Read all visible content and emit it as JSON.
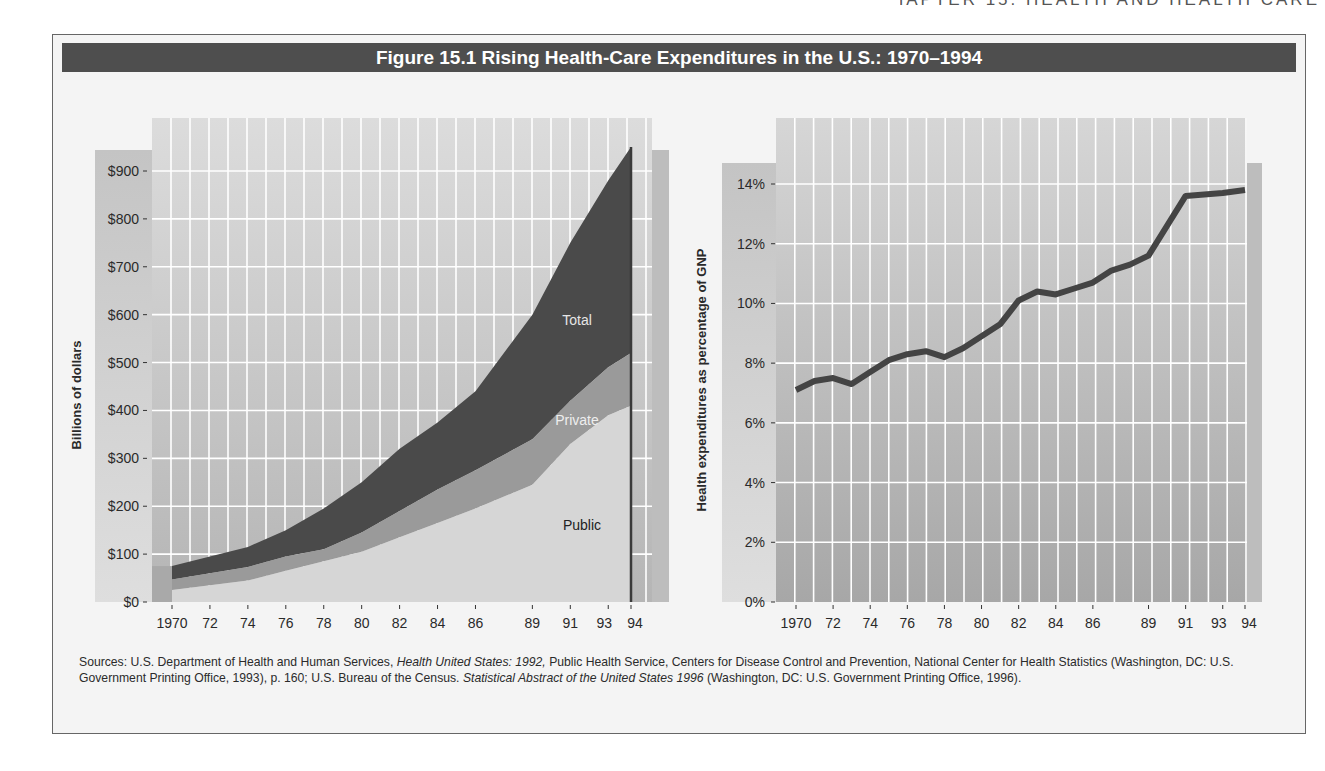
{
  "page": {
    "running_head": "CHAPTER 15: HEALTH AND HEALTH CARE"
  },
  "figure": {
    "title": "Figure 15.1  Rising Health-Care Expenditures in the U.S.: 1970–1994",
    "sources": {
      "prefix": "Sources: U.S. Department of Health and Human Services, ",
      "italic1": "Health United States: 1992,",
      "mid": " Public Health Service, Centers for Disease Control and Prevention, National Center for Health Statistics (Washington, DC: U.S. Government Printing Office, 1993), p. 160; U.S. Bureau of the Census. ",
      "italic2": "Statistical Abstract of the United States 1996",
      "suffix": " (Washington, DC: U.S. Government Printing Office, 1996)."
    }
  },
  "colors": {
    "title_bar": "#4e4e4e",
    "plot_bg_top": "#d9d9d9",
    "plot_bg_bottom": "#a9a9a9",
    "grid": "#ffffff",
    "total_band": "#4a4a4a",
    "private_band": "#9a9a9a",
    "public_band": "#d6d6d6",
    "line": "#444444"
  },
  "chart_data": [
    {
      "type": "area",
      "title": "Health-care expenditures (stacked area)",
      "xlabel": "",
      "ylabel": "Billions of dollars",
      "x_tick_labels": [
        "1970",
        "72",
        "74",
        "76",
        "78",
        "80",
        "82",
        "84",
        "86",
        "89",
        "91",
        "93",
        "94"
      ],
      "y_tick_labels": [
        "$0",
        "$100",
        "$200",
        "$300",
        "$400",
        "$500",
        "$600",
        "$700",
        "$800",
        "$900"
      ],
      "ylim": [
        0,
        950
      ],
      "grid": true,
      "x": [
        1970,
        1972,
        1974,
        1976,
        1978,
        1980,
        1982,
        1984,
        1986,
        1989,
        1991,
        1993,
        1994
      ],
      "series": [
        {
          "name": "Public",
          "values": [
            25,
            35,
            45,
            65,
            85,
            105,
            135,
            165,
            195,
            245,
            330,
            390,
            410
          ]
        },
        {
          "name": "Private",
          "values": [
            22,
            25,
            28,
            30,
            25,
            40,
            55,
            70,
            80,
            95,
            90,
            100,
            110
          ]
        },
        {
          "name": "Total",
          "values": [
            75,
            95,
            115,
            150,
            195,
            250,
            320,
            375,
            440,
            600,
            750,
            880,
            950
          ]
        }
      ],
      "annotations": [
        "Total",
        "Private",
        "Public"
      ]
    },
    {
      "type": "line",
      "title": "Health expenditures as percentage of GNP",
      "xlabel": "",
      "ylabel": "Health expenditures as percentage of GNP",
      "x_tick_labels": [
        "1970",
        "72",
        "74",
        "76",
        "78",
        "80",
        "82",
        "84",
        "86",
        "89",
        "91",
        "93",
        "94"
      ],
      "y_tick_labels": [
        "0%",
        "2%",
        "4%",
        "6%",
        "8%",
        "10%",
        "12%",
        "14%"
      ],
      "ylim": [
        0,
        14.8
      ],
      "grid": true,
      "x": [
        1970,
        1971,
        1972,
        1973,
        1974,
        1975,
        1976,
        1977,
        1978,
        1979,
        1980,
        1981,
        1982,
        1983,
        1984,
        1985,
        1986,
        1987,
        1988,
        1989,
        1991,
        1993,
        1994
      ],
      "series": [
        {
          "name": "Health expenditures as % of GNP",
          "values": [
            7.1,
            7.4,
            7.5,
            7.3,
            7.7,
            8.1,
            8.3,
            8.4,
            8.2,
            8.5,
            8.9,
            9.3,
            10.1,
            10.4,
            10.3,
            10.5,
            10.7,
            11.1,
            11.3,
            11.6,
            13.6,
            13.7,
            13.8
          ]
        }
      ]
    }
  ],
  "left": {
    "ylabel": "Billions of dollars",
    "labels": {
      "total": "Total",
      "private": "Private",
      "public": "Public"
    }
  },
  "right": {
    "ylabel": "Health expenditures as percentage of GNP"
  }
}
